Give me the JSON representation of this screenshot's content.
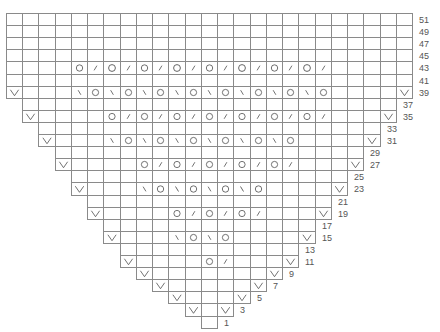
{
  "chart_data": {
    "type": "table",
    "grid": {
      "columns": 25,
      "rows": 26,
      "left": 7,
      "top": 14,
      "cell_w": 16.24,
      "cell_h": 12.1
    },
    "legend_symbols": {
      "V": "v-mark",
      "O": "yarn-over circle",
      "/": "right-leaning decrease",
      "\\": "left-leaning decrease",
      ".": "blank"
    },
    "rows": [
      {
        "label": "51",
        "start": 0,
        "cells": "........................."
      },
      {
        "label": "49",
        "start": 0,
        "cells": "........................."
      },
      {
        "label": "47",
        "start": 0,
        "cells": "........................."
      },
      {
        "label": "45",
        "start": 0,
        "cells": "........................."
      },
      {
        "label": "43",
        "start": 0,
        "cells": "....O/O/O/O/O/O/O/O/....."
      },
      {
        "label": "41",
        "start": 0,
        "cells": "........................."
      },
      {
        "label": "39",
        "start": 0,
        "cells": "V...\\O\\O\\O\\O\\O\\O\\O\\O....V"
      },
      {
        "label": "37",
        "start": 1,
        "cells": "......................."
      },
      {
        "label": "35",
        "start": 1,
        "cells": "V....O/O/O/O/O/O/O/...V"
      },
      {
        "label": "33",
        "start": 2,
        "cells": "....................."
      },
      {
        "label": "31",
        "start": 2,
        "cells": "V...\\O\\O\\O\\O\\O\\O....V"
      },
      {
        "label": "29",
        "start": 3,
        "cells": "..................."
      },
      {
        "label": "27",
        "start": 3,
        "cells": "V....O/O/O/O/O/...V"
      },
      {
        "label": "25",
        "start": 4,
        "cells": "................."
      },
      {
        "label": "23",
        "start": 4,
        "cells": "V...\\O\\O\\O\\O....V"
      },
      {
        "label": "21",
        "start": 5,
        "cells": "..............."
      },
      {
        "label": "19",
        "start": 5,
        "cells": "V....O/O/O/...V"
      },
      {
        "label": "17",
        "start": 6,
        "cells": "............."
      },
      {
        "label": "15",
        "start": 6,
        "cells": "V...\\O\\O....V"
      },
      {
        "label": "13",
        "start": 7,
        "cells": "..........."
      },
      {
        "label": "11",
        "start": 7,
        "cells": "V....O/...V"
      },
      {
        "label": "9",
        "start": 8,
        "cells": "V.......V"
      },
      {
        "label": "7",
        "start": 9,
        "cells": "V.....V"
      },
      {
        "label": "5",
        "start": 10,
        "cells": "V...V"
      },
      {
        "label": "3",
        "start": 11,
        "cells": "V.V"
      },
      {
        "label": "1",
        "start": 12,
        "cells": "."
      }
    ],
    "colors": {
      "grid_line": "#8a8a8a",
      "symbol": "#555555",
      "label": "#555555"
    }
  }
}
